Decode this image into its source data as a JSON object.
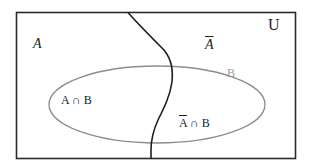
{
  "diagram": {
    "type": "venn",
    "universe_label": "U",
    "region_labels": {
      "a": "A",
      "a_complement": "A",
      "b": "B",
      "a_intersect_b": "A ∩ B",
      "a_complement_intersect_b_prefix": "A",
      "a_complement_intersect_b_suffix": " ∩ B"
    },
    "colors": {
      "border": "#2a2a2a",
      "curve": "#1e1e1e",
      "ellipse": "#8c8c8c",
      "label_b": "#9a9a9a"
    }
  }
}
